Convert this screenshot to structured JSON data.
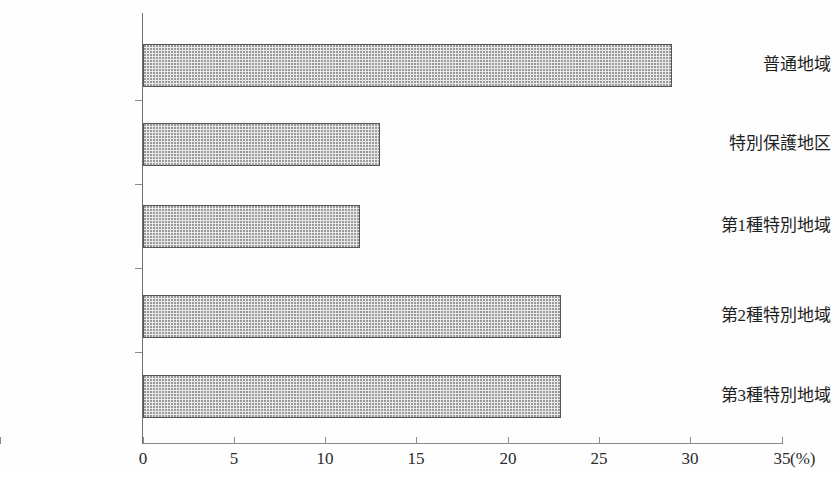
{
  "chart_data": {
    "type": "bar",
    "orientation": "horizontal",
    "title": "",
    "xlabel": "",
    "ylabel": "",
    "unit_label": "(%)",
    "categories": [
      "普通地域",
      "特別保護地区",
      "第1種特別地域",
      "第2種特別地域",
      "第3種特別地域"
    ],
    "values": [
      29.0,
      13.0,
      11.9,
      22.9,
      22.9
    ],
    "xlim": [
      0,
      35
    ],
    "xticks": [
      0,
      5,
      10,
      15,
      20,
      25,
      30,
      35
    ],
    "xtick_labels": [
      "0",
      "5",
      "10",
      "15",
      "20",
      "25",
      "30",
      "35"
    ],
    "grid": false,
    "legend": null,
    "bar_fill_color": "#e9e9e9",
    "bar_border_color": "#555555",
    "axis_color": "#8a8a8a"
  }
}
